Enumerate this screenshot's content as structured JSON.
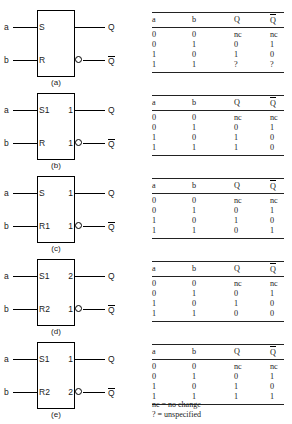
{
  "figure": {
    "symbol_labels": {
      "input_a": "a",
      "input_b": "b",
      "output_q": "Q",
      "output_qbar": "Q"
    },
    "blocks": [
      {
        "caption": "(a)",
        "in_top": "S",
        "in_bot": "R",
        "out_top": "",
        "out_bot": "",
        "bubble": true
      },
      {
        "caption": "(b)",
        "in_top": "S1",
        "in_bot": "R",
        "out_top": "1",
        "out_bot": "1",
        "bubble": true
      },
      {
        "caption": "(c)",
        "in_top": "S",
        "in_bot": "R1",
        "out_top": "1",
        "out_bot": "1",
        "bubble": true
      },
      {
        "caption": "(d)",
        "in_top": "S1",
        "in_bot": "R2",
        "out_top": "2",
        "out_bot": "1",
        "bubble": true
      },
      {
        "caption": "(e)",
        "in_top": "S1",
        "in_bot": "R2",
        "out_top": "1",
        "out_bot": "2",
        "bubble": true
      }
    ],
    "tables": [
      {
        "headers": [
          "a",
          "b",
          "Q",
          "Q"
        ],
        "rows": [
          [
            "0",
            "0",
            "nc",
            "nc"
          ],
          [
            "0",
            "1",
            "0",
            "1"
          ],
          [
            "1",
            "0",
            "1",
            "0"
          ],
          [
            "1",
            "1",
            "?",
            "?"
          ]
        ]
      },
      {
        "headers": [
          "a",
          "b",
          "Q",
          "Q"
        ],
        "rows": [
          [
            "0",
            "0",
            "nc",
            "nc"
          ],
          [
            "0",
            "1",
            "0",
            "1"
          ],
          [
            "1",
            "0",
            "1",
            "0"
          ],
          [
            "1",
            "1",
            "1",
            "0"
          ]
        ]
      },
      {
        "headers": [
          "a",
          "b",
          "Q",
          "Q"
        ],
        "rows": [
          [
            "0",
            "0",
            "nc",
            "nc"
          ],
          [
            "0",
            "1",
            "0",
            "1"
          ],
          [
            "1",
            "0",
            "1",
            "0"
          ],
          [
            "1",
            "1",
            "0",
            "1"
          ]
        ]
      },
      {
        "headers": [
          "a",
          "b",
          "Q",
          "Q"
        ],
        "rows": [
          [
            "0",
            "0",
            "nc",
            "nc"
          ],
          [
            "0",
            "1",
            "0",
            "1"
          ],
          [
            "1",
            "0",
            "1",
            "0"
          ],
          [
            "1",
            "1",
            "0",
            "0"
          ]
        ]
      },
      {
        "headers": [
          "a",
          "b",
          "Q",
          "Q"
        ],
        "rows": [
          [
            "0",
            "0",
            "nc",
            "nc"
          ],
          [
            "0",
            "1",
            "0",
            "1"
          ],
          [
            "1",
            "0",
            "1",
            "0"
          ],
          [
            "1",
            "1",
            "1",
            "1"
          ]
        ]
      }
    ],
    "footnotes": [
      "nc = no change",
      "? = unspecified"
    ]
  }
}
